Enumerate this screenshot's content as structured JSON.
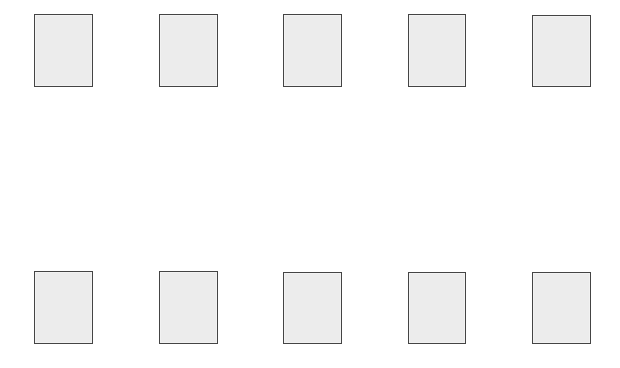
{
  "canvas": {
    "width": 620,
    "height": 368,
    "background": "#ffffff"
  },
  "style": {
    "box_fill": "#ececec",
    "box_border": "#444444"
  },
  "rows": [
    {
      "name": "top-row",
      "boxes": [
        {
          "x": 34,
          "y": 14,
          "w": 59,
          "h": 73
        },
        {
          "x": 159,
          "y": 14,
          "w": 59,
          "h": 73
        },
        {
          "x": 283,
          "y": 14,
          "w": 59,
          "h": 73
        },
        {
          "x": 408,
          "y": 14,
          "w": 58,
          "h": 73
        },
        {
          "x": 532,
          "y": 15,
          "w": 59,
          "h": 72
        }
      ]
    },
    {
      "name": "bottom-row",
      "boxes": [
        {
          "x": 34,
          "y": 271,
          "w": 59,
          "h": 73
        },
        {
          "x": 159,
          "y": 271,
          "w": 59,
          "h": 73
        },
        {
          "x": 283,
          "y": 272,
          "w": 59,
          "h": 72
        },
        {
          "x": 408,
          "y": 272,
          "w": 58,
          "h": 72
        },
        {
          "x": 532,
          "y": 272,
          "w": 59,
          "h": 72
        }
      ]
    }
  ]
}
